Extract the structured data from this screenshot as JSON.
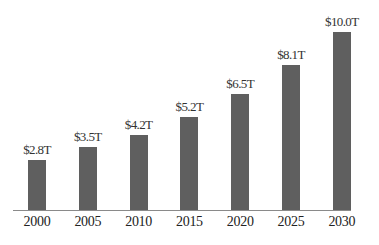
{
  "chart_data": {
    "type": "bar",
    "title": "",
    "xlabel": "",
    "ylabel": "",
    "categories": [
      "2000",
      "2005",
      "2010",
      "2015",
      "2020",
      "2025",
      "2030"
    ],
    "values": [
      2.8,
      3.5,
      4.2,
      5.2,
      6.5,
      8.1,
      10.0
    ],
    "data_labels": [
      "$2.8T",
      "$3.5T",
      "$4.2T",
      "$5.2T",
      "$6.5T",
      "$8.1T",
      "$10.0T"
    ],
    "unit": "trillion USD",
    "grid": false,
    "legend": null,
    "bar_color": "#5f5f5f"
  }
}
